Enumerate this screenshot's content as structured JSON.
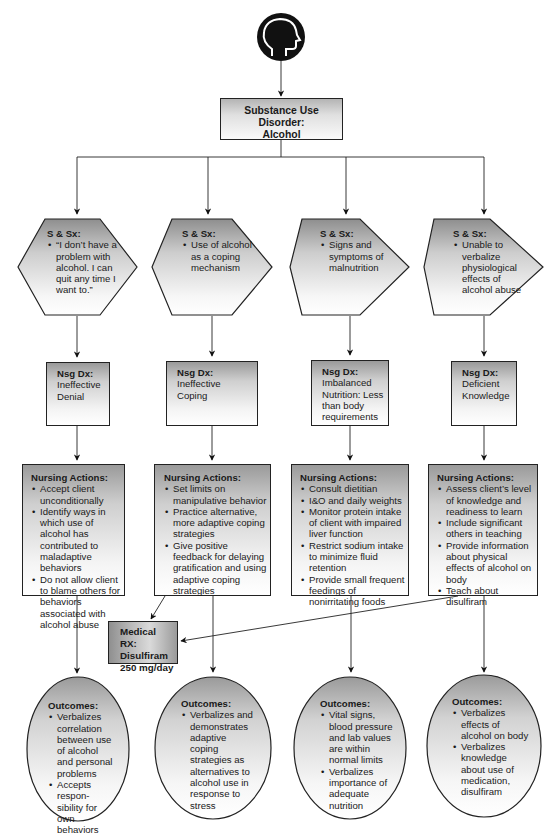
{
  "diagram": {
    "icon": "head-profile-icon",
    "root": {
      "label_lines": [
        "Substance Use",
        "Disorder:",
        "Alcohol"
      ]
    },
    "columns": [
      {
        "signs_symptoms": {
          "heading": "S & Sx:",
          "items": [
            "“I don’t have a problem with alcohol. I can quit any time I want to.”"
          ]
        },
        "nursing_dx": {
          "heading": "Nsg Dx:",
          "text": "Ineffective Denial"
        },
        "nursing_actions": {
          "heading": "Nursing Actions:",
          "items": [
            "Accept client unconditionally",
            "Identify ways in which use of alcohol has contributed to maladaptive behaviors",
            "Do not allow client to blame others for behaviors associated with alcohol abuse"
          ]
        },
        "outcomes": {
          "heading": "Outcomes:",
          "items": [
            "Verbalizes correlation between use of alcohol and personal problems",
            "Accepts respon-sibility for own behaviors"
          ]
        }
      },
      {
        "signs_symptoms": {
          "heading": "S & Sx:",
          "items": [
            "Use of alcohol as a coping mechanism"
          ]
        },
        "nursing_dx": {
          "heading": "Nsg Dx:",
          "text": "Ineffective Coping"
        },
        "nursing_actions": {
          "heading": "Nursing Actions:",
          "items": [
            "Set limits on manipulative behavior",
            "Practice alternative, more adaptive coping strategies",
            "Give positive feedback for delaying gratification and using adaptive coping strategies"
          ]
        },
        "outcomes": {
          "heading": "Outcomes:",
          "items": [
            "Verbalizes and demonstrates adaptive coping strategies as alternatives to alcohol use in response to stress"
          ]
        }
      },
      {
        "signs_symptoms": {
          "heading": "S & Sx:",
          "items": [
            "Signs and symptoms of malnutrition"
          ]
        },
        "nursing_dx": {
          "heading": "Nsg Dx:",
          "text": "Imbalanced Nutrition: Less than body requirements"
        },
        "nursing_actions": {
          "heading": "Nursing Actions:",
          "items": [
            "Consult dietitian",
            "I&O and daily weights",
            "Monitor protein intake of client with impaired liver function",
            "Restrict sodium intake to minimize fluid retention",
            "Provide small frequent feedings of nonirritating foods"
          ]
        },
        "outcomes": {
          "heading": "Outcomes:",
          "items": [
            "Vital signs, blood pressure and lab values are within normal limits",
            "Verbalizes importance of adequate nutrition"
          ]
        }
      },
      {
        "signs_symptoms": {
          "heading": "S & Sx:",
          "items": [
            "Unable to verbalize physiological effects of alcohol abuse"
          ]
        },
        "nursing_dx": {
          "heading": "Nsg Dx:",
          "text": "Deficient Knowledge"
        },
        "nursing_actions": {
          "heading": "Nursing Actions:",
          "items": [
            "Assess client’s level of knowledge and readiness to learn",
            "Include significant others in teaching",
            "Provide information about physical effects of alcohol on body",
            "Teach about disulfiram"
          ]
        },
        "outcomes": {
          "heading": "Outcomes:",
          "items": [
            "Verbalizes effects of alcohol on body",
            "Verbalizes knowledge about use of medication, disulfiram"
          ]
        }
      }
    ],
    "medical_rx": {
      "heading": "Medical RX:",
      "drug": "Disulfiram",
      "dose": "250 mg/day"
    },
    "colors": {
      "line": "#222222",
      "icon_bg": "#111111",
      "box_grad_dark": "#9a9a9a",
      "box_grad_light": "#ffffff"
    }
  }
}
